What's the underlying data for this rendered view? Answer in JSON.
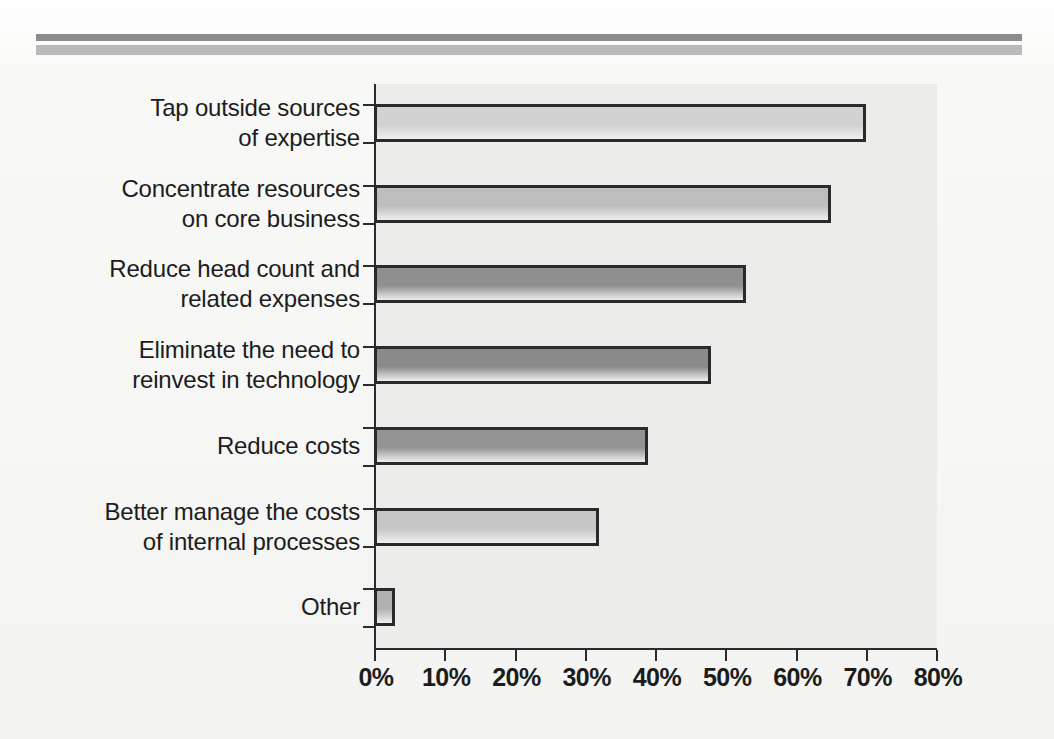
{
  "page": {
    "background_color": "#f6f6f4",
    "panel_color": "#ececea",
    "rule_dark_color": "#8c8c8c",
    "rule_light_color": "#b9b9b9",
    "axis_color": "#2b2b2b"
  },
  "chart_data": {
    "type": "bar",
    "orientation": "horizontal",
    "title": "",
    "subtitle": "",
    "xlabel": "",
    "ylabel": "",
    "xlim": [
      0,
      80
    ],
    "grid": false,
    "legend": false,
    "tick_labels": [
      "0%",
      "10%",
      "20%",
      "30%",
      "40%",
      "50%",
      "60%",
      "70%",
      "80%"
    ],
    "tick_values": [
      0,
      10,
      20,
      30,
      40,
      50,
      60,
      70,
      80
    ],
    "categories": [
      "Tap outside sources\nof expertise",
      "Concentrate resources\non core business",
      "Reduce head count and\nrelated expenses",
      "Eliminate the need to\nreinvest in technology",
      "Reduce costs",
      "Better manage the costs\nof internal processes",
      "Other"
    ],
    "values": [
      70,
      65,
      53,
      48,
      39,
      32,
      3
    ],
    "value_labels": [
      "70%",
      "65%",
      "53%",
      "48%",
      "39%",
      "32%",
      "3%"
    ],
    "bar_fill_colors": [
      "#d2d2d2",
      "#bdbdbd",
      "#8f8f8f",
      "#8a8a8a",
      "#939393",
      "#c6c6c6",
      "#b0b0b0"
    ],
    "bar_border_color": "#2a2a2a"
  }
}
